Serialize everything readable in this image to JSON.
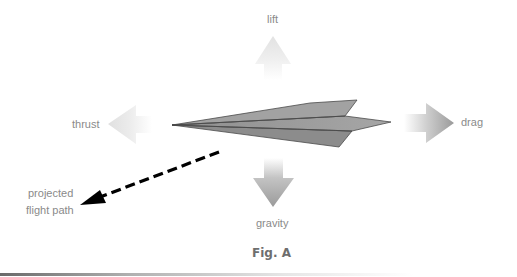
{
  "diagram": {
    "forces": {
      "lift": "lift",
      "thrust": "thrust",
      "drag": "drag",
      "gravity": "gravity"
    },
    "path_label_line1": "projected",
    "path_label_line2": "flight path",
    "caption": "Fig. A",
    "colors": {
      "plane_fill": "#9a9a9a",
      "plane_stroke": "#4a4a4a",
      "arrow_light": "#e6e6e6",
      "arrow_dark": "#9c9c9c",
      "path_arrow": "#000000",
      "label_text": "#8a8a8a",
      "caption_text": "#6e6e6e"
    }
  }
}
